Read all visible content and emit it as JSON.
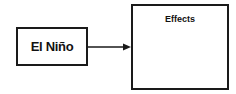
{
  "diagram": {
    "cause_box": {
      "label": "El Niño"
    },
    "effects_box": {
      "label": "Effects"
    },
    "connector": {
      "type": "arrow",
      "from": "El Niño",
      "to": "Effects"
    }
  }
}
